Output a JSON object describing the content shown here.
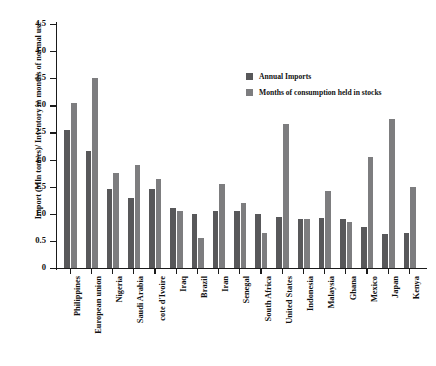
{
  "chart_data": {
    "type": "bar",
    "title": "",
    "xlabel": "",
    "ylabel": "Import (Mln tonnes)/ Inventory in months of normal use",
    "ylim": [
      0,
      4.5
    ],
    "ytick_labels": [
      "0",
      "0.5",
      "1.0",
      "1.5",
      "2.0",
      "2.5",
      "3.0",
      "3.5",
      "4.0",
      "4.5"
    ],
    "ytick_values": [
      0,
      0.5,
      1.0,
      1.5,
      2.0,
      2.5,
      3.0,
      3.5,
      4.0,
      4.5
    ],
    "grid": false,
    "legend_position": "upper-right-inside",
    "categories": [
      "Philippines",
      "European union",
      "Nigeria",
      "Saudi Arabia",
      "cote d'Ivoire",
      "Iraq",
      "Brazil",
      "Iran",
      "Senegal",
      "South Africa",
      "United States",
      "Indonesia",
      "Malaysia",
      "Ghana",
      "Mexico",
      "Japan",
      "Kenya"
    ],
    "series": [
      {
        "name": "Annual Imports",
        "color": "#58585a",
        "values": [
          2.55,
          2.15,
          1.45,
          1.3,
          1.45,
          1.1,
          1.0,
          1.05,
          1.05,
          1.0,
          0.95,
          0.9,
          0.92,
          0.9,
          0.75,
          0.62,
          0.65
        ]
      },
      {
        "name": "Months of consumption held in stocks",
        "color": "#7d7d7f",
        "values": [
          3.05,
          3.5,
          1.75,
          1.9,
          1.65,
          1.05,
          0.55,
          1.55,
          1.2,
          0.65,
          2.65,
          0.9,
          1.42,
          0.85,
          2.05,
          2.75,
          1.5
        ]
      }
    ]
  },
  "legend": {
    "items": [
      {
        "label": "Annual Imports",
        "color": "#58585a"
      },
      {
        "label": "Months of consumption held in stocks",
        "color": "#7d7d7f"
      }
    ]
  }
}
